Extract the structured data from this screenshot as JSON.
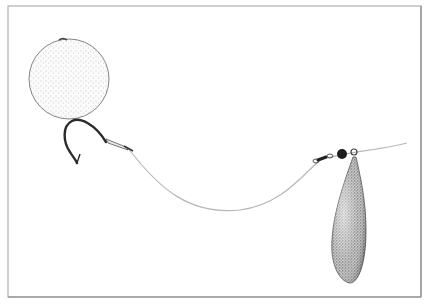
{
  "figure": {
    "components": [
      "boilie-bait",
      "hook",
      "hair-rig",
      "line",
      "swivel",
      "bead",
      "lead-weight"
    ],
    "colors": {
      "background": "#ffffff",
      "frame": "#a8a8a8",
      "frame_shadow": "#cfcfcf",
      "line": "#b5b5b5",
      "outline": "#6a6a6a",
      "hook": "#2a2a2a",
      "bead": "#1e1e1e",
      "stipple": "#555555",
      "lead_fill": "#9a9a9a"
    }
  }
}
